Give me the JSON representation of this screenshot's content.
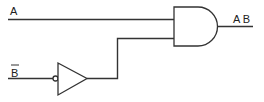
{
  "diagram": {
    "type": "logic-circuit",
    "inputs": [
      {
        "id": "A",
        "label": "A"
      },
      {
        "id": "B_bar",
        "label": "B",
        "overline": true
      }
    ],
    "gates": [
      {
        "id": "not",
        "type": "NOT",
        "input": "B_bar"
      },
      {
        "id": "and",
        "type": "AND",
        "inputs": [
          "A",
          "not"
        ]
      }
    ],
    "output": {
      "label": "A B"
    }
  }
}
